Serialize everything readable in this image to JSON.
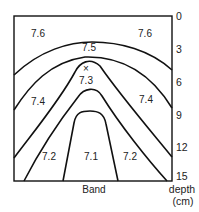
{
  "diagram": {
    "type": "contour-cross-section",
    "box": {
      "left": 14,
      "top": 16,
      "right": 172,
      "bottom": 181
    },
    "line_color": "#111111",
    "text_color": "#222222",
    "bottom_label": "Band",
    "marker": {
      "symbol": "×",
      "x": 86,
      "y": 67
    },
    "regions": [
      {
        "value": "7.6",
        "x": 38,
        "y": 37
      },
      {
        "value": "7.6",
        "x": 145,
        "y": 37
      },
      {
        "value": "7.5",
        "x": 89,
        "y": 51
      },
      {
        "value": "7.3",
        "x": 86,
        "y": 84
      },
      {
        "value": "7.4",
        "x": 38,
        "y": 105
      },
      {
        "value": "7.4",
        "x": 146,
        "y": 103
      },
      {
        "value": "7.2",
        "x": 49,
        "y": 160
      },
      {
        "value": "7.1",
        "x": 91,
        "y": 160
      },
      {
        "value": "7.2",
        "x": 130,
        "y": 160
      }
    ],
    "axis": {
      "title_line1": "depth",
      "title_line2": "(cm)",
      "ticks": [
        {
          "label": "0",
          "y": 20
        },
        {
          "label": "3",
          "y": 53
        },
        {
          "label": "6",
          "y": 86
        },
        {
          "label": "9",
          "y": 119
        },
        {
          "label": "12",
          "y": 151
        },
        {
          "label": "15",
          "y": 180
        }
      ]
    }
  }
}
